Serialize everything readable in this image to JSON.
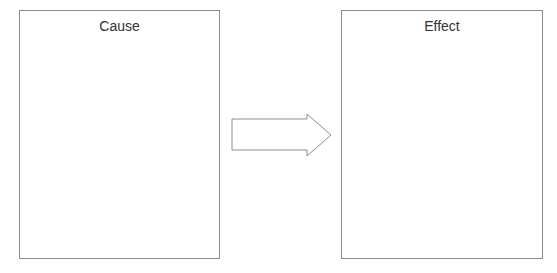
{
  "diagram": {
    "type": "cause-effect",
    "boxes": [
      {
        "id": "cause",
        "label": "Cause"
      },
      {
        "id": "effect",
        "label": "Effect"
      }
    ],
    "arrow": {
      "from": "cause",
      "to": "effect",
      "direction": "right"
    },
    "colors": {
      "stroke": "#8c8c8c",
      "text": "#333333",
      "background": "#ffffff"
    }
  }
}
